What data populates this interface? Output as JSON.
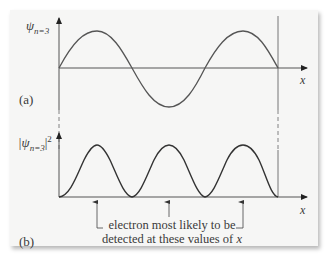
{
  "figure": {
    "panel_a": {
      "label": "(a)",
      "y_axis_label": "ψ",
      "y_axis_subscript": "n=3",
      "x_axis_label": "x",
      "curve": "sine wave, 1.5 wavelengths (3 half-waves) between walls"
    },
    "panel_b": {
      "label": "(b)",
      "y_axis_label_prefix": "|ψ",
      "y_axis_subscript": "n=3",
      "y_axis_label_suffix": "|",
      "y_axis_superscript": "2",
      "x_axis_label": "x",
      "curve": "sine-squared, three equal peaks"
    },
    "annotation": {
      "line1": "electron most likely to be",
      "line2_prefix": "detected at these values of ",
      "line2_var": "x"
    },
    "colors": {
      "panel_background": "#f6f6f5",
      "line": "#555555",
      "text": "#3a3a3a"
    }
  }
}
